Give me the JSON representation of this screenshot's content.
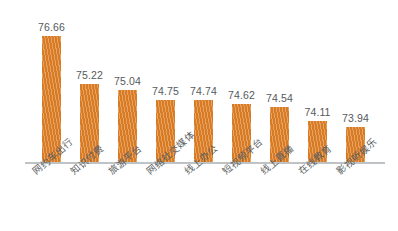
{
  "chart_data": {
    "type": "bar",
    "title": "",
    "subtitle": "",
    "xlabel": "",
    "ylabel": "",
    "grid": false,
    "legend": null,
    "ylim": [
      73.0,
      77.2
    ],
    "categories": [
      "网约车出行",
      "知识付费",
      "旅游平台",
      "网络社交媒体",
      "线上办公",
      "短视频平台",
      "线上直播",
      "在线教育",
      "影视听娱乐"
    ],
    "values": [
      76.66,
      75.22,
      75.04,
      74.75,
      74.74,
      74.62,
      74.54,
      74.11,
      73.94
    ],
    "value_labels": [
      "76.66",
      "75.22",
      "75.04",
      "74.75",
      "74.74",
      "74.62",
      "74.54",
      "74.11",
      "73.94"
    ],
    "bar_color": "#d97b22",
    "baseline_color": "#bfc3c6",
    "label_color": "#55595c",
    "background": "#ffffff"
  }
}
